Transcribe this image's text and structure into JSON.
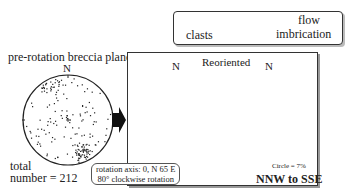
{
  "legend": {
    "clasts_label": "clasts",
    "flow_label": "flow",
    "imbrication_label": "imbrication",
    "arrow_icon": "left-arrow"
  },
  "left_panel": {
    "title": "pre-rotation breccia plane",
    "north_label": "N",
    "total_label": "total",
    "number_label": "number = ",
    "total_value": "212"
  },
  "rotation": {
    "line1": "rotation axis: 0, N 65 E",
    "line2": "80° clockwise rotation"
  },
  "right_panel": {
    "title": "Reoriented",
    "north_label_stereonet": "N",
    "north_label_rose": "N",
    "circle_scale": "Circle = 7%",
    "result": "NNW to SSE"
  },
  "colors": {
    "ink": "#222222",
    "frame": "#333333",
    "shadow": "#999999"
  }
}
